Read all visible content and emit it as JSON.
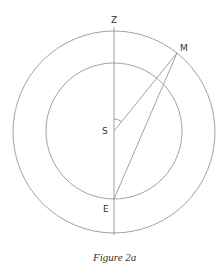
{
  "figure": {
    "caption": "Figure 2a",
    "labels": {
      "zenith": "Z",
      "moon": "M",
      "sun": "S",
      "earth": "E"
    },
    "colors": {
      "stroke": "#8a8a8a",
      "text": "#333333",
      "background": "#ffffff"
    }
  }
}
